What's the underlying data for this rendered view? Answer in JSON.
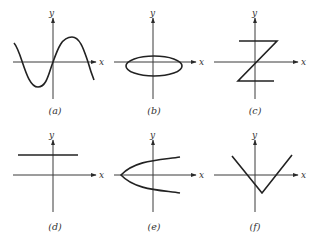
{
  "figure": {
    "panels": [
      {
        "id": "a",
        "caption": "(a)",
        "x_label": "x",
        "y_label": "y",
        "curve": "sine wave"
      },
      {
        "id": "b",
        "caption": "(b)",
        "x_label": "x",
        "y_label": "y",
        "curve": "ellipse centered on origin"
      },
      {
        "id": "c",
        "caption": "(c)",
        "x_label": "x",
        "y_label": "y",
        "curve": "Z-shape: top horizontal, diagonal through origin, bottom horizontal"
      },
      {
        "id": "d",
        "caption": "(d)",
        "x_label": "x",
        "y_label": "y",
        "curve": "horizontal line above x-axis"
      },
      {
        "id": "e",
        "caption": "(e)",
        "x_label": "x",
        "y_label": "y",
        "curve": "sideways parabola opening right"
      },
      {
        "id": "f",
        "caption": "(f)",
        "x_label": "x",
        "y_label": "y",
        "curve": "V-shape (absolute value) with vertex below x-axis"
      }
    ]
  }
}
